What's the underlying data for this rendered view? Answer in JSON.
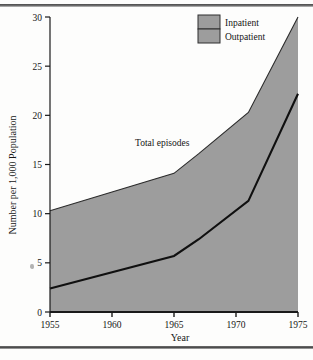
{
  "figure": {
    "background_color": "#fdfdfc",
    "rule_color": "#4a4a4a"
  },
  "chart_data": {
    "type": "area",
    "title": "",
    "subtitle": "",
    "xlabel": "Year",
    "ylabel": "Number per 1,000 Population",
    "xlim": [
      1955,
      1975
    ],
    "ylim": [
      0,
      30
    ],
    "xticks": [
      1955,
      1960,
      1965,
      1970,
      1975
    ],
    "xtick_labels": [
      "1955",
      "1960",
      "1965",
      "1970",
      "1975"
    ],
    "yticks": [
      0,
      5,
      10,
      15,
      20,
      25,
      30
    ],
    "ytick_labels": [
      "0",
      "5",
      "10",
      "15",
      "20",
      "25",
      "30"
    ],
    "grid": false,
    "stacked": true,
    "legend_position": "top-right",
    "legend_entries": [
      {
        "label": "Inpatient",
        "color": "#9d9d9d"
      },
      {
        "label": "Outpatient",
        "color": "#9d9d9d"
      }
    ],
    "annotations": [
      {
        "text": "Total episodes",
        "x": 1965.0,
        "y": 17.0
      }
    ],
    "x": [
      1955,
      1965,
      1967,
      1971,
      1975
    ],
    "series": [
      {
        "name": "Inpatient",
        "role": "lower-boundary",
        "values": [
          2.4,
          5.7,
          7.4,
          11.3,
          22.2
        ]
      },
      {
        "name": "Total episodes",
        "role": "upper-boundary",
        "values": [
          10.3,
          14.1,
          16.1,
          20.3,
          30.0
        ]
      }
    ],
    "colors": {
      "area_fill": "#9d9d9d",
      "line": "#101010",
      "axis": "#1a1a1a"
    }
  }
}
